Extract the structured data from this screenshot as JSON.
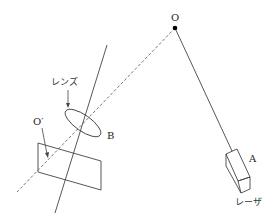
{
  "diagram": {
    "type": "physics-optics-setup",
    "colors": {
      "line": "#444444",
      "dashed": "#666666",
      "dot": "#000000",
      "text": "#222222"
    },
    "labels": {
      "point_o": "O",
      "point_o_prime": "O′",
      "point_a": "A",
      "point_b": "B",
      "lens": "レンズ",
      "laser": "レーザ"
    },
    "elements": {
      "laser_beam": "solid line from laser A to point O",
      "reflected_path": "dashed line from O through lens B to screen at O′",
      "lens_axis_line": "solid line passing through lens",
      "lens": "tilted ellipse labeled レンズ at B",
      "screen": "parallelogram screen containing O′",
      "laser_box": "rectangular box at A labeled レーザ"
    }
  }
}
